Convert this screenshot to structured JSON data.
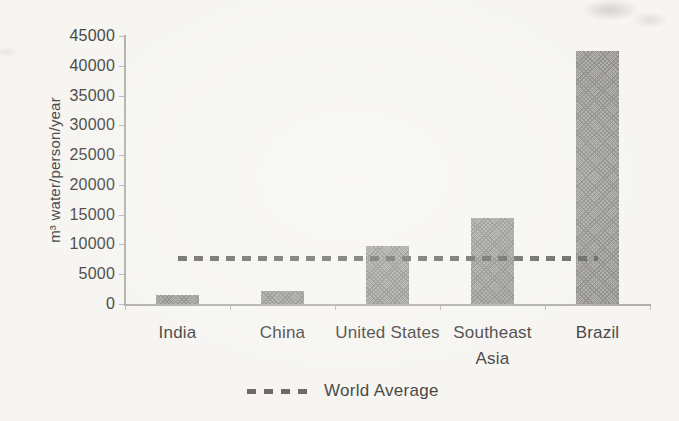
{
  "chart_data": {
    "type": "bar",
    "title": "",
    "xlabel": "",
    "ylabel": "m³ water/person/year",
    "categories": [
      "India",
      "China",
      "United States",
      "Southeast Asia",
      "Brazil"
    ],
    "values": [
      1500,
      2100,
      9800,
      14500,
      42500
    ],
    "ylim": [
      0,
      45000
    ],
    "ytick_step": 5000,
    "grid": false,
    "overlay_line": {
      "name": "World Average",
      "value": 7600,
      "style": "dashed"
    },
    "legend": {
      "position": "bottom-center",
      "entries": [
        {
          "label": "World Average",
          "marker": "dashed-line"
        }
      ]
    }
  },
  "colors": {
    "background": "#f6f5f2",
    "bar": "#aeadaa",
    "bar_texture": "#908f8b",
    "dashed_line": "#6b6a68",
    "axis": "#b3b1ae",
    "tick": "#bcbab7",
    "text": "#4a4947"
  }
}
